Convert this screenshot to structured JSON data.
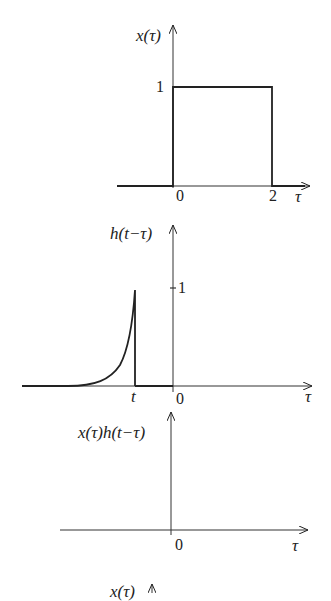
{
  "panels": [
    {
      "ylabel": "x(τ)",
      "xlabel": "τ",
      "tick_labels": {
        "y_one": "1",
        "x_zero": "0",
        "x_two": "2"
      },
      "description": "Rectangular pulse of height 1 from τ=0 to τ=2"
    },
    {
      "ylabel": "h(t−τ)",
      "xlabel": "τ",
      "tick_labels": {
        "y_one": "1",
        "x_t": "t",
        "x_zero": "0"
      },
      "description": "Time-reversed exponential rising to 1 at τ=t (t<0), zero for τ>t"
    },
    {
      "ylabel": "x(τ)h(t−τ)",
      "xlabel": "τ",
      "tick_labels": {
        "x_zero": "0"
      },
      "description": "Product is zero everywhere (no overlap for t<0)"
    },
    {
      "ylabel": "x(τ)",
      "description": "Partially visible next panel label at bottom"
    }
  ],
  "colors": {
    "ink": "#222222",
    "background": "#ffffff"
  }
}
